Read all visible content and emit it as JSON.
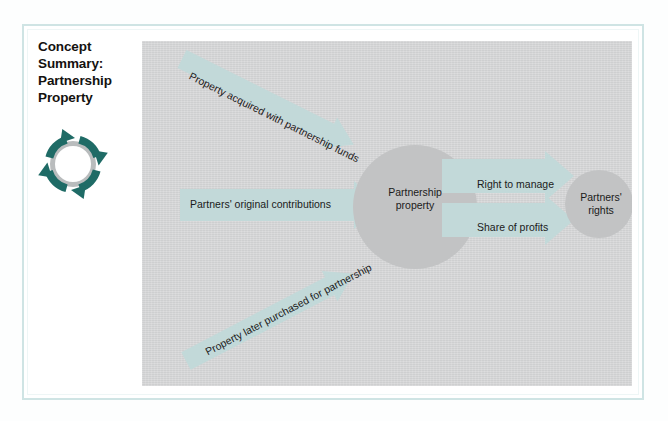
{
  "page": {
    "background_color": "#fdfefe",
    "frame_border_color": "#cfe4e4"
  },
  "title": {
    "line1": "Concept",
    "line2": "Summary:",
    "line3": "Partnership",
    "line4": "Property",
    "full": "Concept Summary: Partnership Property"
  },
  "icon": {
    "name": "cycle-arrows-icon",
    "arrow_color": "#1f6b66",
    "ring_color": "#b9bcbd"
  },
  "diagram": {
    "panel_color": "#d2d3d4",
    "arrow_color": "#c2d9d9",
    "node_color": "#c2c3c4",
    "nodes": [
      {
        "id": "partnership-property",
        "line1": "Partnership",
        "line2": "property"
      },
      {
        "id": "partners-rights",
        "line1": "Partners'",
        "line2": "rights"
      }
    ],
    "inputs": [
      {
        "id": "acquired-with-funds",
        "label": "Property acquired with partnership funds",
        "direction": "diagonal-down-right"
      },
      {
        "id": "original-contributions",
        "label": "Partners' original contributions",
        "direction": "horizontal-right"
      },
      {
        "id": "later-purchased",
        "label": "Property later purchased for partnership",
        "direction": "diagonal-up-right"
      }
    ],
    "outputs": [
      {
        "id": "right-to-manage",
        "label": "Right to manage",
        "direction": "horizontal-right"
      },
      {
        "id": "share-of-profits",
        "label": "Share of profits",
        "direction": "horizontal-right"
      }
    ]
  }
}
